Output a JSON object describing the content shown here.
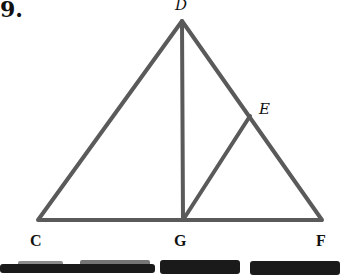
{
  "problem": {
    "number": "9."
  },
  "figure": {
    "type": "geometry",
    "line_color": "#5a5a5a",
    "line_width": 4,
    "points": {
      "D": {
        "label": "D",
        "x": 182,
        "y": 21
      },
      "C": {
        "label": "C",
        "x": 38,
        "y": 220
      },
      "F": {
        "label": "F",
        "x": 322,
        "y": 220
      },
      "G": {
        "label": "G",
        "x": 183,
        "y": 220
      },
      "E": {
        "label": "E",
        "x": 250,
        "y": 116
      }
    },
    "segments": [
      "CD",
      "DF",
      "CF",
      "DG",
      "GE"
    ]
  },
  "labels": {
    "D": "D",
    "E": "E",
    "C": "C",
    "G": "G",
    "F": "F"
  }
}
